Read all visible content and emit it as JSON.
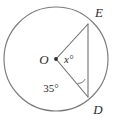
{
  "figure": {
    "type": "circle-geometry-diagram",
    "background_color": "#ffffff",
    "stroke_color": "#6b6b6b",
    "label_color": "#2b2b2b",
    "circle": {
      "center_label": "O",
      "center_dot_label": "center-dot",
      "cx": 56,
      "cy": 59,
      "r": 52
    },
    "points": [
      {
        "name": "E",
        "label": "E",
        "x": 88,
        "y": 24,
        "label_x": 99,
        "label_y": 17
      },
      {
        "name": "D",
        "label": "D",
        "x": 88,
        "y": 97,
        "label_x": 98,
        "label_y": 114
      }
    ],
    "segments": [
      {
        "name": "radius-OE",
        "from": "O",
        "to": "E"
      },
      {
        "name": "radius-OD",
        "from": "O",
        "to": "D"
      },
      {
        "name": "chord-ED",
        "from": "E",
        "to": "D"
      }
    ],
    "angles": [
      {
        "name": "central-angle-EOD",
        "vertex": "O",
        "label": "x°",
        "label_x": 64,
        "label_y": 63
      },
      {
        "name": "inscribed-angle-ODE",
        "vertex": "D",
        "label": "35°",
        "label_x": 51,
        "label_y": 92,
        "has_arc_marker": true
      }
    ]
  }
}
